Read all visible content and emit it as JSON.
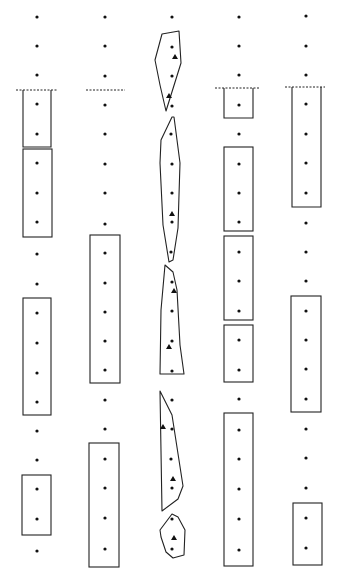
{
  "diagram": {
    "width": 337,
    "height": 577,
    "stroke_color": "#222222",
    "dot_color": "#111111",
    "columns_x": [
      37,
      105,
      172,
      239,
      306
    ],
    "rows_y": [
      17,
      46,
      75,
      104,
      134,
      163,
      193,
      222,
      251,
      281,
      310,
      340,
      369,
      398,
      428,
      457,
      487,
      516,
      545
    ],
    "dashed_lines": [
      {
        "x1": 16,
        "x2": 58,
        "y": 90
      },
      {
        "x1": 86,
        "x2": 125,
        "y": 90
      },
      {
        "x1": 215,
        "x2": 260,
        "y": 88
      },
      {
        "x1": 285,
        "x2": 325,
        "y": 87
      }
    ],
    "rectangles": [
      {
        "col": 0,
        "x": 23,
        "y": 90,
        "w": 28,
        "h": 57,
        "open_top": true
      },
      {
        "col": 0,
        "x": 23,
        "y": 149,
        "w": 29,
        "h": 88
      },
      {
        "col": 0,
        "x": 23,
        "y": 298,
        "w": 28,
        "h": 117
      },
      {
        "col": 0,
        "x": 22,
        "y": 475,
        "w": 29,
        "h": 60
      },
      {
        "col": 1,
        "x": 90,
        "y": 235,
        "w": 30,
        "h": 148
      },
      {
        "col": 1,
        "x": 89,
        "y": 443,
        "w": 30,
        "h": 124
      },
      {
        "col": 3,
        "x": 224,
        "y": 88,
        "w": 29,
        "h": 30,
        "open_top": true
      },
      {
        "col": 3,
        "x": 224,
        "y": 147,
        "w": 29,
        "h": 84
      },
      {
        "col": 3,
        "x": 224,
        "y": 236,
        "w": 29,
        "h": 84
      },
      {
        "col": 3,
        "x": 224,
        "y": 325,
        "w": 29,
        "h": 57
      },
      {
        "col": 3,
        "x": 224,
        "y": 413,
        "w": 29,
        "h": 153
      },
      {
        "col": 4,
        "x": 292,
        "y": 87,
        "w": 29,
        "h": 120,
        "open_top": true
      },
      {
        "col": 4,
        "x": 291,
        "y": 296,
        "w": 30,
        "h": 116
      },
      {
        "col": 4,
        "x": 293,
        "y": 503,
        "w": 29,
        "h": 62
      }
    ],
    "polygons": [
      {
        "points": "162,34 179,31 181,63 176,79 166,111 160,85 155,60"
      },
      {
        "points": "172,117 174,117 180,163 179,195 178,228 173,260 169,262 163,225 160,163 161,140"
      },
      {
        "points": "165,265 173,272 177,290 180,345 184,374 160,374 161,310"
      },
      {
        "points": "160,391 172,415 183,486 178,499 162,511"
      },
      {
        "points": "172,514 178,517 185,530 184,555 173,558 166,552 161,537 160,530"
      }
    ],
    "triangles": [
      {
        "x": 175,
        "y": 57
      },
      {
        "x": 169,
        "y": 96
      },
      {
        "x": 172,
        "y": 214
      },
      {
        "x": 174,
        "y": 291
      },
      {
        "x": 169,
        "y": 347
      },
      {
        "x": 163,
        "y": 427
      },
      {
        "x": 173,
        "y": 479
      },
      {
        "x": 174,
        "y": 538
      }
    ],
    "dots": [
      [
        37,
        17
      ],
      [
        37,
        46
      ],
      [
        37,
        75
      ],
      [
        37,
        104
      ],
      [
        37,
        134
      ],
      [
        37,
        163
      ],
      [
        37,
        193
      ],
      [
        37,
        222
      ],
      [
        37,
        254
      ],
      [
        37,
        284
      ],
      [
        37,
        313
      ],
      [
        37,
        343
      ],
      [
        37,
        373
      ],
      [
        37,
        402
      ],
      [
        37,
        431
      ],
      [
        37,
        460
      ],
      [
        37,
        489
      ],
      [
        37,
        519
      ],
      [
        37,
        551
      ],
      [
        105,
        17
      ],
      [
        105,
        46
      ],
      [
        105,
        76
      ],
      [
        105,
        105
      ],
      [
        105,
        134
      ],
      [
        105,
        164
      ],
      [
        105,
        193
      ],
      [
        105,
        224
      ],
      [
        105,
        253
      ],
      [
        105,
        283
      ],
      [
        105,
        312
      ],
      [
        105,
        341
      ],
      [
        105,
        370
      ],
      [
        105,
        400
      ],
      [
        105,
        429
      ],
      [
        105,
        459
      ],
      [
        105,
        488
      ],
      [
        105,
        518
      ],
      [
        105,
        549
      ],
      [
        172,
        17
      ],
      [
        172,
        47
      ],
      [
        172,
        76
      ],
      [
        172,
        106
      ],
      [
        171,
        134
      ],
      [
        172,
        164
      ],
      [
        172,
        193
      ],
      [
        172,
        222
      ],
      [
        171,
        252
      ],
      [
        172,
        282
      ],
      [
        172,
        311
      ],
      [
        172,
        341
      ],
      [
        172,
        371
      ],
      [
        172,
        400
      ],
      [
        172,
        429
      ],
      [
        171,
        459
      ],
      [
        172,
        488
      ],
      [
        172,
        519
      ],
      [
        172,
        549
      ],
      [
        239,
        17
      ],
      [
        239,
        46
      ],
      [
        239,
        75
      ],
      [
        239,
        105
      ],
      [
        239,
        134
      ],
      [
        239,
        164
      ],
      [
        239,
        193
      ],
      [
        239,
        222
      ],
      [
        239,
        252
      ],
      [
        239,
        281
      ],
      [
        239,
        311
      ],
      [
        239,
        340
      ],
      [
        239,
        370
      ],
      [
        239,
        399
      ],
      [
        239,
        430
      ],
      [
        239,
        459
      ],
      [
        239,
        489
      ],
      [
        239,
        519
      ],
      [
        239,
        550
      ],
      [
        306,
        16
      ],
      [
        306,
        46
      ],
      [
        306,
        75
      ],
      [
        306,
        104
      ],
      [
        306,
        134
      ],
      [
        306,
        163
      ],
      [
        306,
        193
      ],
      [
        306,
        223
      ],
      [
        306,
        252
      ],
      [
        306,
        281
      ],
      [
        306,
        311
      ],
      [
        306,
        340
      ],
      [
        306,
        369
      ],
      [
        306,
        399
      ],
      [
        306,
        429
      ],
      [
        306,
        458
      ],
      [
        306,
        488
      ],
      [
        306,
        518
      ],
      [
        306,
        548
      ]
    ]
  }
}
